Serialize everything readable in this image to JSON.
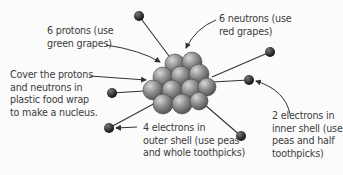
{
  "diagram": {
    "type": "atom-model",
    "labels": {
      "protons": [
        "6 protons (use",
        "green grapes)"
      ],
      "neutrons": [
        "6 neutrons (use",
        "red grapes)"
      ],
      "nucleus": [
        "Cover the protons",
        "and neutrons in",
        "plastic food wrap",
        "to make a nucleus."
      ],
      "outer_electrons": [
        "4 electrons in",
        "outer shell (use peas",
        "and whole toothpicks)"
      ],
      "inner_electrons": [
        "2 electrons in",
        "inner shell (use",
        "peas and half",
        "toothpicks)"
      ]
    },
    "counts": {
      "protons": 6,
      "neutrons": 6,
      "inner_electrons": 2,
      "outer_electrons": 4
    }
  }
}
